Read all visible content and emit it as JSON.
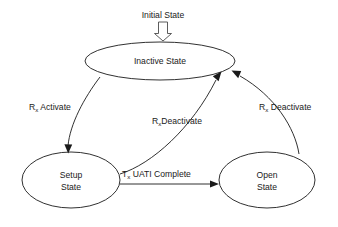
{
  "diagram": {
    "background_color": "#ffffff",
    "line_color": "#1a1a1a",
    "entry": {
      "label": "Initial State",
      "icon": "block-arrow-down-icon"
    },
    "states": [
      {
        "id": "inactive",
        "label": "Inactive State",
        "label_lines": [
          "Inactive State"
        ]
      },
      {
        "id": "setup",
        "label": "Setup State",
        "label_lines": [
          "Setup",
          "State"
        ]
      },
      {
        "id": "open",
        "label": "Open State",
        "label_lines": [
          "Open",
          "State"
        ]
      }
    ],
    "transitions": [
      {
        "id": "inactive-to-setup",
        "from": "inactive",
        "to": "setup",
        "label": "R_x Activate",
        "label_prefix": "R",
        "label_subscript": "x",
        "label_suffix": " Activate"
      },
      {
        "id": "setup-to-inactive",
        "from": "setup",
        "to": "inactive",
        "label": "R_xDeactivate",
        "label_prefix": "R",
        "label_subscript": "x",
        "label_suffix": "Deactivate"
      },
      {
        "id": "open-to-inactive",
        "from": "open",
        "to": "inactive",
        "label": "R_x Deactivate",
        "label_prefix": "R",
        "label_subscript": "x",
        "label_suffix": " Deactivate"
      },
      {
        "id": "setup-to-open",
        "from": "setup",
        "to": "open",
        "label": "T_x  UATI Complete",
        "label_prefix": "T",
        "label_subscript": "x",
        "label_suffix": "  UATI Complete"
      }
    ]
  }
}
